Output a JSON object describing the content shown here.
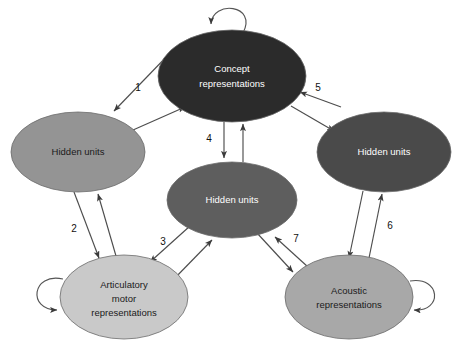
{
  "figure": {
    "background_color": "#ffffff",
    "width": 464,
    "height": 356
  },
  "palette": {
    "concept_fill": "#2b2b2b",
    "hidden_right_fill": "#4a4a4a",
    "hidden_center_fill": "#5e5e5e",
    "hidden_left_fill": "#949494",
    "acoustic_fill": "#a8a8a8",
    "articulatory_fill": "#c9c9c9",
    "edge_color": "#4d4d4d",
    "node_stroke": "#6b6b6b",
    "light_text": "#ffffff",
    "dark_text": "#1a1a1a"
  },
  "nodes": [
    {
      "id": "concept",
      "label_lines": [
        "Concept",
        "representations"
      ],
      "cx": 232,
      "cy": 76,
      "rx": 74,
      "ry": 46,
      "fill": "#2b2b2b",
      "text_class": "light",
      "self_loop": "top"
    },
    {
      "id": "hidden-left",
      "label_lines": [
        "Hidden units"
      ],
      "cx": 78,
      "cy": 152,
      "rx": 67,
      "ry": 40,
      "fill": "#949494",
      "text_class": "dark",
      "self_loop": "none"
    },
    {
      "id": "hidden-right",
      "label_lines": [
        "Hidden units"
      ],
      "cx": 384,
      "cy": 152,
      "rx": 67,
      "ry": 40,
      "fill": "#4a4a4a",
      "text_class": "light",
      "self_loop": "none"
    },
    {
      "id": "hidden-center",
      "label_lines": [
        "Hidden units"
      ],
      "cx": 232,
      "cy": 200,
      "rx": 65,
      "ry": 38,
      "fill": "#5e5e5e",
      "text_class": "light",
      "self_loop": "none"
    },
    {
      "id": "articulatory",
      "label_lines": [
        "Articulatory",
        "motor",
        "representations"
      ],
      "cx": 124,
      "cy": 297,
      "rx": 64,
      "ry": 42,
      "fill": "#c9c9c9",
      "text_class": "dark",
      "self_loop": "left"
    },
    {
      "id": "acoustic",
      "label_lines": [
        "Acoustic",
        "representations"
      ],
      "cx": 349,
      "cy": 297,
      "rx": 64,
      "ry": 42,
      "fill": "#a8a8a8",
      "text_class": "dark",
      "self_loop": "right"
    }
  ],
  "edges": [
    {
      "id": "edge-1",
      "number": "1",
      "from": "hidden-left",
      "to": "concept",
      "label_x": 138,
      "label_y": 88,
      "bidirectional": true
    },
    {
      "id": "edge-2",
      "number": "2",
      "from": "hidden-left",
      "to": "articulatory",
      "label_x": 74,
      "label_y": 229,
      "bidirectional": true
    },
    {
      "id": "edge-3",
      "number": "3",
      "from": "articulatory",
      "to": "hidden-center",
      "label_x": 163,
      "label_y": 242,
      "bidirectional": true
    },
    {
      "id": "edge-4",
      "number": "4",
      "from": "concept",
      "to": "hidden-center",
      "label_x": 209,
      "label_y": 139,
      "bidirectional": true
    },
    {
      "id": "edge-5",
      "number": "5",
      "from": "hidden-right",
      "to": "concept",
      "label_x": 318,
      "label_y": 88,
      "bidirectional": true
    },
    {
      "id": "edge-6",
      "number": "6",
      "from": "acoustic",
      "to": "hidden-right",
      "label_x": 390,
      "label_y": 226,
      "bidirectional": true
    },
    {
      "id": "edge-7",
      "number": "7",
      "from": "hidden-center",
      "to": "acoustic",
      "label_x": 296,
      "label_y": 239,
      "bidirectional": true
    }
  ]
}
